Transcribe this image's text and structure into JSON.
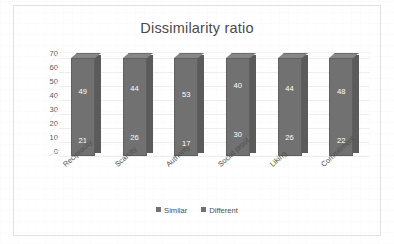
{
  "chart_data": {
    "type": "bar",
    "subtype": "stacked-3d-column",
    "title": "Dissimilarity ratio",
    "xlabel": "",
    "ylabel": "",
    "ylim": [
      0,
      70
    ],
    "yticks": [
      70,
      60,
      50,
      40,
      30,
      20,
      10,
      0
    ],
    "grid": true,
    "legend_position": "bottom",
    "categories": [
      "Reciprocity",
      "Scarcity",
      "Authority",
      "Social proof",
      "Liking",
      "Commitment"
    ],
    "series": [
      {
        "name": "Similar",
        "values": [
          21,
          26,
          17,
          30,
          26,
          22
        ],
        "color": "#717171"
      },
      {
        "name": "Different",
        "values": [
          49,
          44,
          53,
          40,
          44,
          48
        ],
        "color": "#717171"
      }
    ]
  },
  "colors": {
    "bar_front": "#717171",
    "bar_side": "#5b5b5b",
    "bar_top": "#868686",
    "gridline": "#ededed",
    "frame_border": "#e2e2e2",
    "title_text": "#4a4a4a",
    "axis_text": "#595959",
    "data_label_text": "#ffffff",
    "background": "#ffffff"
  },
  "legend": {
    "entries": [
      {
        "label": "Similar",
        "swatch": "#717171"
      },
      {
        "label": "Different",
        "swatch": "#717171"
      }
    ]
  }
}
